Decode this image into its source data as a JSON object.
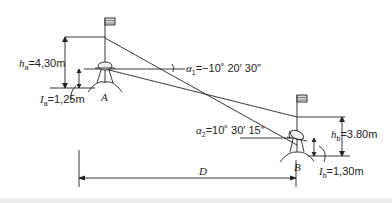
{
  "diagram": {
    "type": "trigonometric-leveling",
    "stations": {
      "A": {
        "label": "A",
        "h_label": "h",
        "h_sub": "a",
        "h_value": "=4,30m",
        "I_label": "I",
        "I_sub": "a",
        "I_value": "=1,25m"
      },
      "B": {
        "label": "B",
        "h_label": "h",
        "h_sub": "b",
        "h_value": "=3.80m",
        "I_label": "I",
        "I_sub": "b",
        "I_value": "=1,30m"
      }
    },
    "angles": {
      "alpha1": {
        "symbol": "α",
        "sub": "1",
        "value": "=−10˚ 20′ 30″"
      },
      "alpha2": {
        "symbol": "α",
        "sub": "2",
        "value": "=10˚ 30′ 15″"
      }
    },
    "distance": {
      "label": "D"
    }
  }
}
